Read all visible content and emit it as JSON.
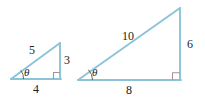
{
  "figure": {
    "background_color": "#ffffff",
    "line_color": "#8cc3d8",
    "right_angle_marker_color": "#a9909e",
    "label_color": "#222224",
    "angle_arc_color": "#4a4a4c"
  },
  "triangles": [
    {
      "id": "small-triangle",
      "name": "left-triangle",
      "vertices": {
        "angle_vertex": [
          11,
          79
        ],
        "right_angle_vertex": [
          60,
          79
        ],
        "apex": [
          60,
          43
        ]
      },
      "labels": {
        "hypotenuse": "5",
        "opposite": "3",
        "adjacent": "4",
        "angle": "θ"
      }
    },
    {
      "id": "large-triangle",
      "name": "right-triangle",
      "vertices": {
        "angle_vertex": [
          78,
          80
        ],
        "right_angle_vertex": [
          180,
          80
        ],
        "apex": [
          180,
          8
        ]
      },
      "labels": {
        "hypotenuse": "10",
        "opposite": "6",
        "adjacent": "8",
        "angle": "θ"
      }
    }
  ]
}
